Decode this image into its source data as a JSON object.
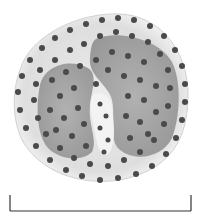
{
  "figure": {
    "colors": {
      "background": "#ffffff",
      "cytoplasm": "#e4e4e4",
      "cytoplasm_edge": "#cfcfcf",
      "nucleus": "#9a9a9a",
      "granule": "#4a4a4a",
      "scale_bar": "#333333"
    },
    "scale_bar": {
      "x1": 10,
      "x2": 191,
      "y_top": 195,
      "y_bottom": 211
    }
  }
}
